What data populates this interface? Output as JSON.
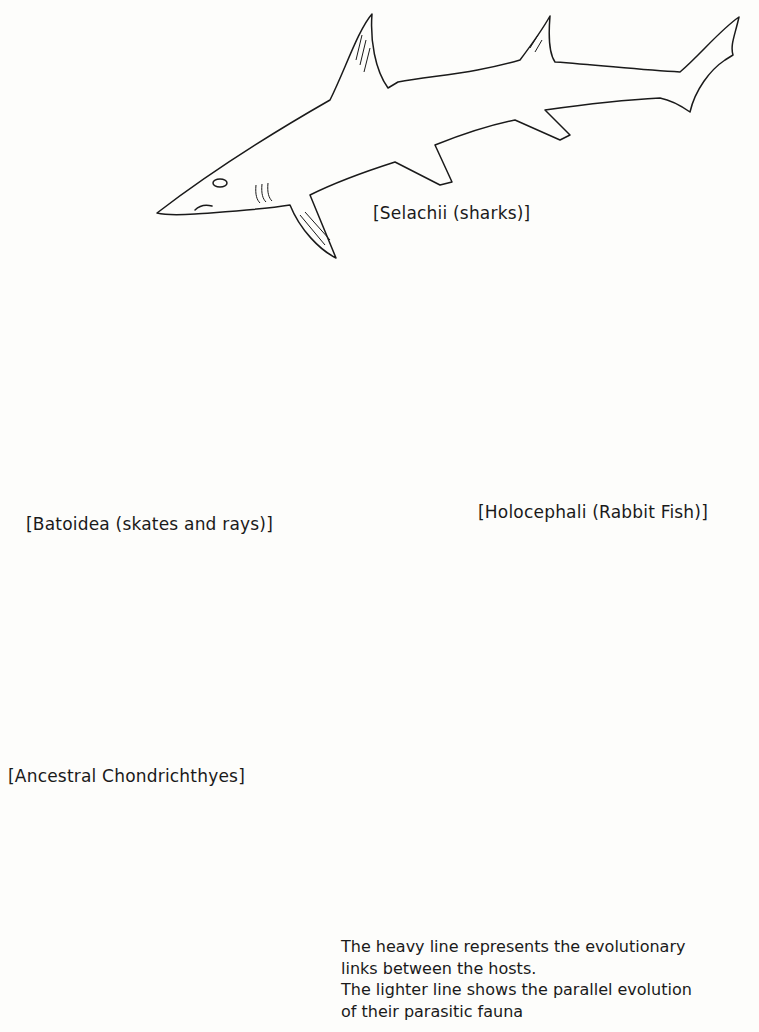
{
  "diagram": {
    "type": "evolutionary tree",
    "nodes": {
      "selachii": {
        "label": "[Selachii (sharks)]"
      },
      "batoidea": {
        "label": "[Batoidea (skates and rays)]"
      },
      "holocephali": {
        "label": "[Holocephali (Rabbit Fish)]"
      },
      "ancestral": {
        "label": "[Ancestral Chondrichthyes]"
      }
    },
    "caption": {
      "line1": "The heavy line represents the evolutionary",
      "line2": "links between the hosts.",
      "line3": "The lighter line shows the parallel evolution",
      "line4": "of their parasitic fauna"
    },
    "legend": {
      "heavy_line": "host evolution",
      "light_line": "parasitic fauna evolution"
    },
    "colors": {
      "ink": "#1a1a1a",
      "paper": "#fdfdfb"
    }
  }
}
